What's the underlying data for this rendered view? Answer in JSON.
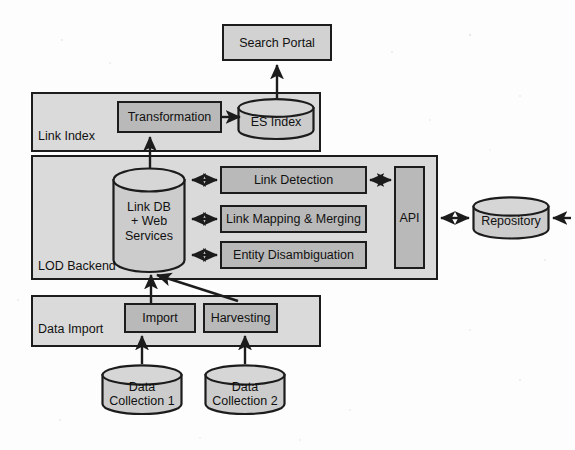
{
  "diagram": {
    "colors": {
      "container_fill": "#dadada",
      "box_fill": "#b9b9b9",
      "plain_box_fill": "#d2d2d2",
      "cylinder_fill": "#cccccc",
      "cylinder_top_fill": "#d6d6d6",
      "stroke": "#1c1c1c",
      "background": "#fdfdfd",
      "text": "#111111"
    },
    "containers": [
      {
        "id": "link-index",
        "label": "Link Index",
        "x": 31,
        "y": 92,
        "w": 290,
        "h": 60
      },
      {
        "id": "lod-backend",
        "label": "LOD Backend",
        "x": 31,
        "y": 155,
        "w": 407,
        "h": 125
      },
      {
        "id": "data-import",
        "label": "Data Import",
        "x": 31,
        "y": 295,
        "w": 290,
        "h": 52
      }
    ],
    "boxes": [
      {
        "id": "search-portal",
        "label": "Search Portal",
        "x": 222,
        "y": 24,
        "w": 110,
        "h": 37,
        "style": "plain"
      },
      {
        "id": "transformation",
        "label": "Transformation",
        "x": 117,
        "y": 101,
        "w": 105,
        "h": 32,
        "style": "box"
      },
      {
        "id": "link-detection",
        "label": "Link Detection",
        "x": 220,
        "y": 166,
        "w": 147,
        "h": 28,
        "style": "box"
      },
      {
        "id": "link-mapping-merging",
        "label": "Link Mapping & Merging",
        "x": 220,
        "y": 205,
        "w": 147,
        "h": 28,
        "style": "box"
      },
      {
        "id": "entity-disambiguation",
        "label": "Entity Disambiguation",
        "x": 220,
        "y": 241,
        "w": 147,
        "h": 28,
        "style": "box"
      },
      {
        "id": "api",
        "label": "API",
        "x": 394,
        "y": 166,
        "w": 31,
        "h": 103,
        "style": "box"
      },
      {
        "id": "import",
        "label": "Import",
        "x": 124,
        "y": 303,
        "w": 72,
        "h": 30,
        "style": "box"
      },
      {
        "id": "harvesting",
        "label": "Harvesting",
        "x": 203,
        "y": 303,
        "w": 75,
        "h": 30,
        "style": "box"
      }
    ],
    "cylinders": [
      {
        "id": "es-index",
        "label": "ES Index",
        "x": 237,
        "y": 98,
        "w": 78,
        "h": 42
      },
      {
        "id": "link-db",
        "label": "Link DB\n+ Web\nServices",
        "x": 112,
        "y": 167,
        "w": 74,
        "h": 106
      },
      {
        "id": "repository",
        "label": "Repository",
        "x": 472,
        "y": 196,
        "w": 78,
        "h": 44
      },
      {
        "id": "data-collection-1",
        "label": "Data Collection 1",
        "x": 101,
        "y": 364,
        "w": 82,
        "h": 52
      },
      {
        "id": "data-collection-2",
        "label": "Data Collection 2",
        "x": 204,
        "y": 364,
        "w": 82,
        "h": 52
      }
    ],
    "connectors": [
      {
        "id": "es-index-to-search-portal",
        "from": "es-index",
        "to": "search-portal",
        "direction": "one-way"
      },
      {
        "id": "transformation-to-es-index",
        "from": "transformation",
        "to": "es-index",
        "direction": "one-way"
      },
      {
        "id": "link-db-to-transformation",
        "from": "link-db",
        "to": "transformation",
        "direction": "one-way"
      },
      {
        "id": "link-db-to-link-detection",
        "from": "link-db",
        "to": "link-detection",
        "direction": "two-way"
      },
      {
        "id": "link-db-to-link-mapping",
        "from": "link-db",
        "to": "link-mapping-merging",
        "direction": "two-way"
      },
      {
        "id": "link-db-to-entity-disamb",
        "from": "link-db",
        "to": "entity-disambiguation",
        "direction": "two-way"
      },
      {
        "id": "link-detection-to-api",
        "from": "link-detection",
        "to": "api",
        "direction": "two-way"
      },
      {
        "id": "api-to-repository",
        "from": "api",
        "to": "repository",
        "direction": "two-way"
      },
      {
        "id": "external-to-api",
        "from": "external",
        "to": "api",
        "direction": "one-way"
      },
      {
        "id": "import-to-link-db",
        "from": "import",
        "to": "link-db",
        "direction": "one-way"
      },
      {
        "id": "harvesting-to-link-db",
        "from": "harvesting",
        "to": "link-db",
        "direction": "one-way"
      },
      {
        "id": "collection1-to-import",
        "from": "data-collection-1",
        "to": "import",
        "direction": "one-way"
      },
      {
        "id": "collection2-to-harvesting",
        "from": "data-collection-2",
        "to": "harvesting",
        "direction": "one-way"
      }
    ]
  }
}
